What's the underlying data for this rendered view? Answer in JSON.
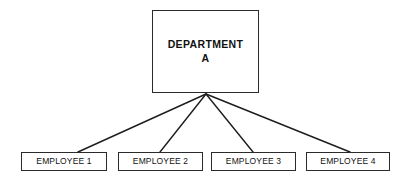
{
  "canvas": {
    "width": 411,
    "height": 182,
    "background": "#ffffff"
  },
  "diagram": {
    "type": "organizational-chart",
    "line_color": "#1d1d1d",
    "border_color": "#2b2b2b",
    "text_color": "#111111",
    "fan_origin": {
      "x": 206,
      "y": 94
    }
  },
  "root": {
    "id": "department-a",
    "label": "DEPARTMENT\nA",
    "label_line_1": "DEPARTMENT",
    "label_line_2": "A",
    "x": 152,
    "y": 10,
    "width": 107,
    "height": 83
  },
  "children": [
    {
      "id": "employee-1",
      "label": "EMPLOYEE 1",
      "x": 21,
      "y": 152,
      "width": 86,
      "height": 19,
      "connect_x": 78
    },
    {
      "id": "employee-2",
      "label": "EMPLOYEE 2",
      "x": 118,
      "y": 152,
      "width": 85,
      "height": 19,
      "connect_x": 160
    },
    {
      "id": "employee-3",
      "label": "EMPLOYEE 3",
      "x": 211,
      "y": 152,
      "width": 85,
      "height": 19,
      "connect_x": 253
    },
    {
      "id": "employee-4",
      "label": "EMPLOYEE 4",
      "x": 306,
      "y": 152,
      "width": 84,
      "height": 19,
      "connect_x": 350
    }
  ]
}
